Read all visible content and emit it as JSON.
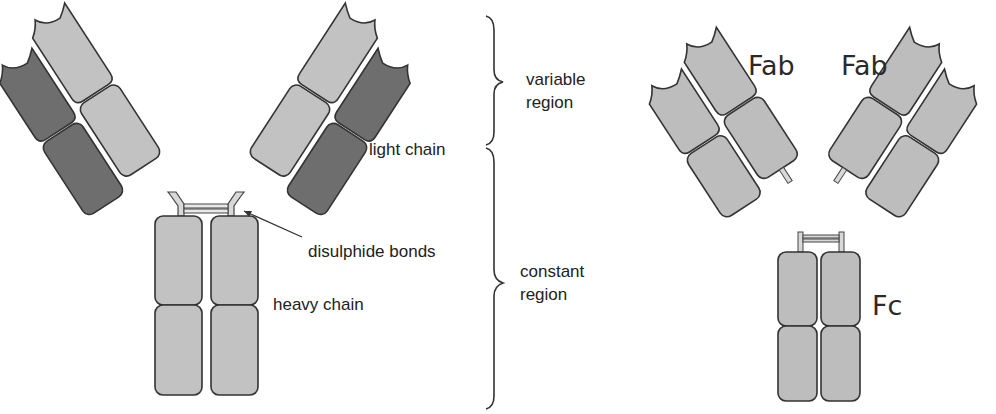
{
  "figure": {
    "intact_antibody": {
      "labels": {
        "light_chain": "light chain",
        "disulphide_bonds": "disulphide bonds",
        "heavy_chain": "heavy chain",
        "variable_region": [
          "variable",
          "region"
        ],
        "constant_region": [
          "constant",
          "region"
        ]
      }
    },
    "fragments": {
      "labels": {
        "fab_left": "Fab",
        "fab_right": "Fab",
        "fc": "Fc"
      }
    }
  },
  "colors": {
    "dark_chain": "#6e6e6e",
    "light_chain": "#c2c2c2",
    "fragment_fill": "#bdbdbd",
    "outline": "#3a3a3a",
    "background": "#ffffff"
  }
}
